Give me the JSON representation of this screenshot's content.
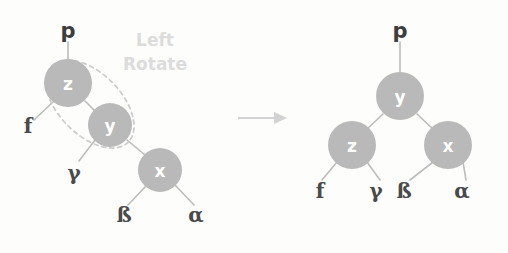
{
  "diagram": {
    "title": "Left Rotate",
    "caption": {
      "line1": "Left",
      "line2": "Rotate"
    },
    "colors": {
      "background": "#fdfdfb",
      "node_fill": "#b9b9b9",
      "node_text": "#ffffff",
      "edge": "#bcbcbc",
      "leaf_text": "#4a4a4a",
      "caption_text": "#dcdcdc",
      "highlight_stroke": "#cdcdcd",
      "arrow": "#d2d2d2"
    },
    "before": {
      "parent_label": "p",
      "nodes": [
        {
          "id": "z",
          "label": "z",
          "cx": 68,
          "cy": 83,
          "r": 24
        },
        {
          "id": "y",
          "label": "y",
          "cx": 110,
          "cy": 125,
          "r": 22
        },
        {
          "id": "x",
          "label": "x",
          "cx": 160,
          "cy": 170,
          "r": 22
        }
      ],
      "leaves": [
        {
          "id": "f",
          "label": "f",
          "x": 28,
          "y": 133
        },
        {
          "id": "gamma",
          "label": "γ",
          "x": 74,
          "y": 180
        },
        {
          "id": "beta",
          "label": "ß",
          "x": 124,
          "y": 222
        },
        {
          "id": "alpha",
          "label": "α",
          "x": 196,
          "y": 222
        }
      ]
    },
    "after": {
      "parent_label": "p",
      "nodes": [
        {
          "id": "y",
          "label": "y",
          "cx": 400,
          "cy": 96,
          "r": 24
        },
        {
          "id": "z",
          "label": "z",
          "cx": 352,
          "cy": 145,
          "r": 24
        },
        {
          "id": "x",
          "label": "x",
          "cx": 448,
          "cy": 145,
          "r": 24
        }
      ],
      "leaves": [
        {
          "id": "f",
          "label": "f",
          "x": 320,
          "y": 198
        },
        {
          "id": "gamma",
          "label": "γ",
          "x": 376,
          "y": 198
        },
        {
          "id": "beta",
          "label": "ß",
          "x": 404,
          "y": 198
        },
        {
          "id": "alpha",
          "label": "α",
          "x": 462,
          "y": 198
        }
      ]
    },
    "arrow": {
      "label": "transform-arrow",
      "x1": 238,
      "x2": 280,
      "y": 118
    }
  }
}
